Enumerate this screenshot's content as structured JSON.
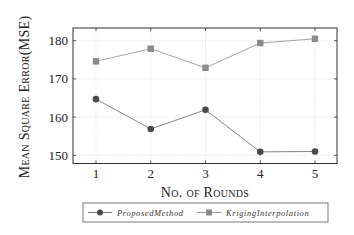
{
  "chart_data": {
    "type": "line",
    "title": "",
    "xlabel": "No. of Rounds",
    "ylabel": "Mean Square Error(MSE)",
    "x": [
      1,
      2,
      3,
      4,
      5
    ],
    "xticks": [
      "1",
      "2",
      "3",
      "4",
      "5"
    ],
    "yticks": [
      "150",
      "160",
      "170",
      "180"
    ],
    "xlim": [
      0.6,
      5.4
    ],
    "ylim": [
      147,
      183
    ],
    "grid": true,
    "legend_position": "bottom-outside",
    "series": [
      {
        "name": "ProposedMethod",
        "marker": "circle",
        "color": "#4a4a4a",
        "line_color": "#777777",
        "values": [
          164.7,
          156.9,
          161.9,
          150.9,
          151.0
        ]
      },
      {
        "name": "KrigingInterpolation",
        "marker": "square",
        "color": "#8a8a8a",
        "line_color": "#9a9a9a",
        "values": [
          174.6,
          177.9,
          172.9,
          179.4,
          180.5
        ]
      }
    ]
  }
}
